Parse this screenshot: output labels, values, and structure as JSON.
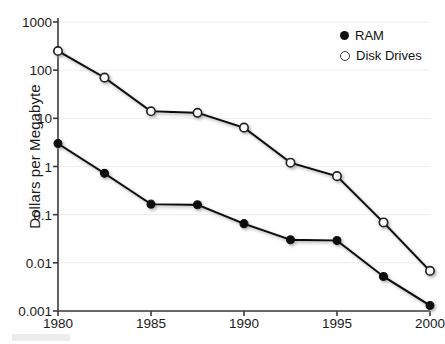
{
  "chart_data": {
    "type": "line",
    "title": "",
    "subtitle": "",
    "xlabel": "",
    "ylabel": "Dollars per Megabyte",
    "x": [
      1980,
      1982.5,
      1985,
      1987.5,
      1990,
      1992.5,
      1995,
      1997.5,
      2000
    ],
    "xlim": [
      1980,
      2000
    ],
    "ylim": [
      0.001,
      1000
    ],
    "yscale": "log",
    "xtick_labels": [
      "1980",
      "1985",
      "1990",
      "1995",
      "2000"
    ],
    "xticks": [
      1980,
      1985,
      1990,
      1995,
      2000
    ],
    "ytick_labels": [
      "1000",
      "100",
      "10",
      "1",
      "0.1",
      "0.01",
      "0.001"
    ],
    "yticks": [
      1000,
      100,
      10,
      1,
      0.1,
      0.01,
      0.001
    ],
    "grid": true,
    "legend_position": "top-right",
    "series": [
      {
        "name": "RAM",
        "marker": "filled-circle",
        "color": "#111111",
        "values": [
          3.0,
          0.72,
          0.165,
          0.16,
          0.065,
          0.03,
          0.029,
          0.0052,
          0.0013
        ]
      },
      {
        "name": "Disk Drives",
        "marker": "open-circle",
        "color": "#111111",
        "values": [
          250,
          70,
          14,
          13,
          6.4,
          1.2,
          0.63,
          0.069,
          0.0068
        ]
      }
    ]
  },
  "legend": {
    "entries": [
      {
        "label": "RAM",
        "marker": "filled-circle"
      },
      {
        "label": "Disk Drives",
        "marker": "open-circle"
      }
    ]
  },
  "axes": {
    "y_title": "Dollars per Megabyte"
  },
  "colors": {
    "line": "#1a1a1a",
    "grid": "#ededed",
    "axis": "#3a3a3a",
    "text": "#1a1a1a",
    "background": "#ffffff"
  }
}
